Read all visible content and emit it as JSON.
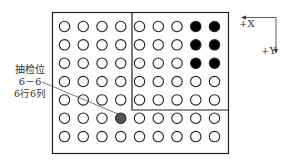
{
  "diagram": {
    "grid": {
      "rows": 7,
      "cols": 9
    },
    "filled_black": [
      [
        1,
        8
      ],
      [
        1,
        9
      ],
      [
        2,
        8
      ],
      [
        2,
        9
      ],
      [
        3,
        8
      ],
      [
        3,
        9
      ]
    ],
    "sample_point": {
      "row": 6,
      "col": 4
    },
    "colors": {
      "outline": "#222222",
      "black_fill": "#000000",
      "sample_fill": "#555555",
      "background": "#ffffff"
    }
  },
  "annotation": {
    "line1": "抽检位",
    "line2": "6－6",
    "line3": "6行6列"
  },
  "axes": {
    "x_label": "+X",
    "y_label": "+Y"
  }
}
